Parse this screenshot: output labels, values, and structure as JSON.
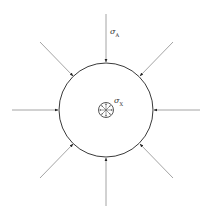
{
  "diagram": {
    "type": "stress-concentration",
    "colors": {
      "outer_circle": "#3a3a3a",
      "arrow_line": "#9a9a9a",
      "arrow_head": "#222222",
      "inner_circle": "#444444"
    },
    "outer_circle": {
      "cx": 106,
      "cy": 110,
      "r": 47
    },
    "inner_circle": {
      "cx": 106,
      "cy": 110,
      "r": 7.5
    },
    "external_arrows_count": 8,
    "internal_arrows_count": 8,
    "labels": {
      "outer_stress_symbol": "σ",
      "outer_stress_sub": "A",
      "inner_stress_symbol": "σ",
      "inner_stress_sub": "X"
    }
  }
}
